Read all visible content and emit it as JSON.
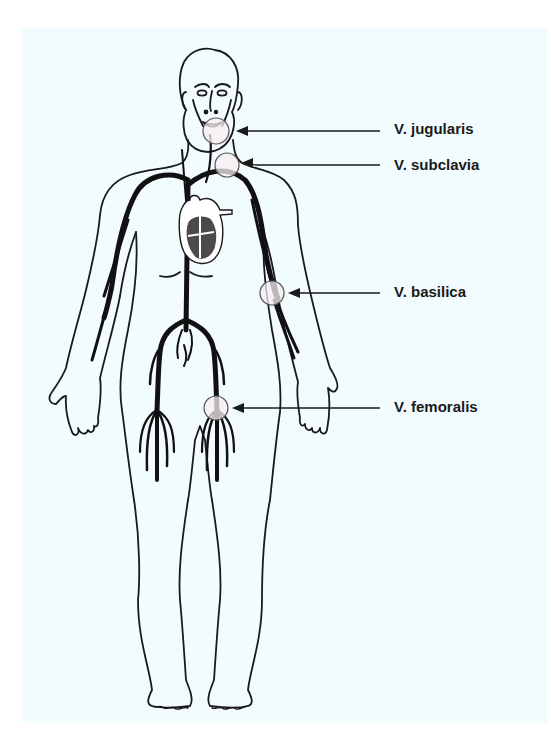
{
  "diagram": {
    "labels": [
      {
        "id": "jugularis",
        "text": "V. jugularis"
      },
      {
        "id": "subclavia",
        "text": "V. subclavia"
      },
      {
        "id": "basilica",
        "text": "V. basilica"
      },
      {
        "id": "femoralis",
        "text": "V. femoralis"
      }
    ],
    "colors": {
      "background_panel": "#f2fbfd",
      "outline": "#1a1a1a",
      "vein": "#111111",
      "highlight_circle_fill": "#f6eef2",
      "heart_chamber": "#4a4a4a"
    }
  }
}
